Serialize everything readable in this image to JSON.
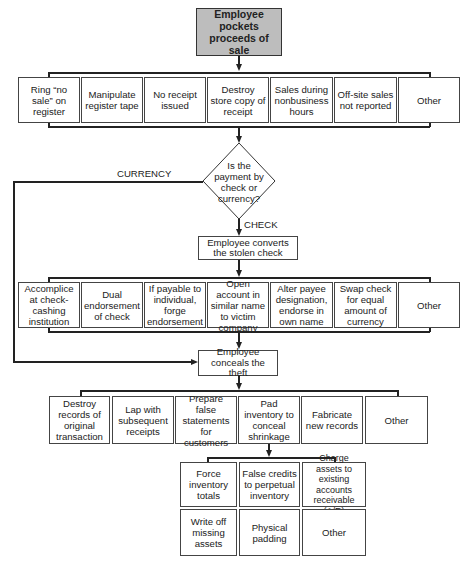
{
  "start": {
    "label": "Employee pockets proceeds of sale"
  },
  "row1": [
    {
      "label": "Ring “no sale” on register"
    },
    {
      "label": "Manipulate register tape"
    },
    {
      "label": "No receipt issued"
    },
    {
      "label": "Destroy store copy of receipt"
    },
    {
      "label": "Sales during nonbusiness hours"
    },
    {
      "label": "Off-site sales not reported"
    },
    {
      "label": "Other"
    }
  ],
  "decision": {
    "question": "Is the payment by check or currency?",
    "branch_left": "CURRENCY",
    "branch_down": "CHECK"
  },
  "convert": {
    "label": "Employee converts the stolen check"
  },
  "row2": [
    {
      "label": "Accomplice at check-cashing institution"
    },
    {
      "label": "Dual endorsement of check"
    },
    {
      "label": "If payable to individual, forge endorsement"
    },
    {
      "label": "Open account in similar name to victim company"
    },
    {
      "label": "Alter payee designation, endorse in own name"
    },
    {
      "label": "Swap check for equal amount of currency"
    },
    {
      "label": "Other"
    }
  ],
  "conceal": {
    "label": "Employee conceals the theft"
  },
  "row3": [
    {
      "label": "Destroy records of original transaction"
    },
    {
      "label": "Lap with subsequent receipts"
    },
    {
      "label": "Prepare false statements for customers"
    },
    {
      "label": "Pad inventory to conceal shrinkage"
    },
    {
      "label": "Fabricate new records"
    },
    {
      "label": "Other"
    }
  ],
  "inventory": [
    {
      "label": "Force inventory totals"
    },
    {
      "label": "False credits to perpetual inventory"
    },
    {
      "label": "Charge assets to existing accounts receivable (A/R)"
    },
    {
      "label": "Write off missing assets"
    },
    {
      "label": "Physical padding"
    },
    {
      "label": "Other"
    }
  ]
}
